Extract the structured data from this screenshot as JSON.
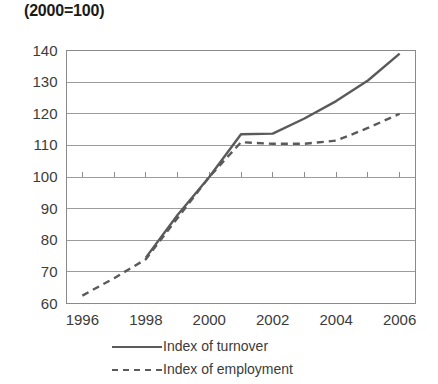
{
  "chart_data": {
    "type": "line",
    "title": "(2000=100)",
    "xlabel": "",
    "ylabel": "",
    "xlim": [
      1995.5,
      2006.5
    ],
    "ylim": [
      60,
      140
    ],
    "grid": true,
    "legend_position": "bottom",
    "y_ticks": [
      60,
      70,
      80,
      90,
      100,
      110,
      120,
      130,
      140
    ],
    "y_tick_labels": [
      "60",
      "70",
      "80",
      "90",
      "100",
      "110",
      "120",
      "130",
      "140"
    ],
    "x_ticks": [
      1996,
      1997,
      1998,
      1999,
      2000,
      2001,
      2002,
      2003,
      2004,
      2005,
      2006
    ],
    "x_tick_labels_shown": [
      "1996",
      "1998",
      "2000",
      "2002",
      "2004",
      "2006"
    ],
    "x_labeled_ticks": [
      1996,
      1998,
      2000,
      2002,
      2004,
      2006
    ],
    "series": [
      {
        "name": "Index of turnover",
        "style": "solid",
        "color": "#5a5a5a",
        "x": [
          1998.0,
          1999.0,
          2000.0,
          2001.0,
          2002.0,
          2003.0,
          2004.0,
          2005.0,
          2006.0
        ],
        "values": [
          74.5,
          88.0,
          100.0,
          113.5,
          113.7,
          118.5,
          124.0,
          130.5,
          139.0
        ]
      },
      {
        "name": "Index of employment",
        "style": "dashed",
        "color": "#5a5a5a",
        "x": [
          1996.0,
          1997.0,
          1998.0,
          1999.0,
          2000.0,
          2001.0,
          2002.0,
          2003.0,
          2004.0,
          2005.0,
          2006.0
        ],
        "values": [
          62.5,
          68.0,
          74.0,
          87.0,
          100.0,
          111.0,
          110.5,
          110.5,
          111.5,
          115.5,
          120.0
        ]
      }
    ]
  },
  "legend": {
    "items": [
      {
        "label": "Index of turnover",
        "style": "solid"
      },
      {
        "label": "Index of employment",
        "style": "dashed"
      }
    ]
  }
}
